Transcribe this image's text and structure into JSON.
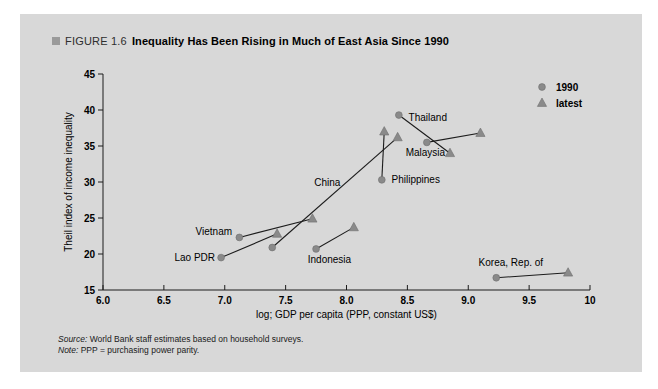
{
  "figure": {
    "label": "FIGURE 1.6",
    "title": "Inequality Has Been Rising in Much of East Asia Since 1990"
  },
  "chart_data": {
    "type": "scatter",
    "title": "Inequality Has Been Rising in Much of East Asia Since 1990",
    "xlabel": "log; GDP per capita (PPP, constant US$)",
    "ylabel": "Theil index of income inequality",
    "xlim": [
      6.0,
      10.0
    ],
    "ylim": [
      15,
      45
    ],
    "x_tick_labels": [
      "6.0",
      "6.5",
      "7.0",
      "7.5",
      "8.0",
      "8.5",
      "9.0",
      "9.5",
      "10"
    ],
    "x_tick_values": [
      6.0,
      6.5,
      7.0,
      7.5,
      8.0,
      8.5,
      9.0,
      9.5,
      10.0
    ],
    "y_tick_values": [
      15,
      20,
      25,
      30,
      35,
      40,
      45
    ],
    "grid": false,
    "legend_position": "top-right",
    "legend": [
      {
        "label": "1990",
        "marker": "circle"
      },
      {
        "label": "latest",
        "marker": "triangle"
      }
    ],
    "series": [
      {
        "name": "Lao PDR",
        "p1990": [
          6.97,
          19.5
        ],
        "latest": [
          7.43,
          22.8
        ],
        "label_at": [
          6.92,
          19.5
        ],
        "label_anchor": "end"
      },
      {
        "name": "Vietnam",
        "p1990": [
          7.12,
          22.3
        ],
        "latest": [
          7.72,
          24.9
        ],
        "label_at": [
          7.06,
          23.1
        ],
        "label_anchor": "end"
      },
      {
        "name": "China",
        "p1990": [
          7.39,
          20.9
        ],
        "latest": [
          8.42,
          36.2
        ],
        "label_at": [
          7.95,
          30.0
        ],
        "label_anchor": "end"
      },
      {
        "name": "Indonesia",
        "p1990": [
          7.75,
          20.7
        ],
        "latest": [
          8.06,
          23.7
        ],
        "label_at": [
          7.86,
          19.2
        ],
        "label_anchor": "middle"
      },
      {
        "name": "Philippines",
        "p1990": [
          8.29,
          30.3
        ],
        "latest": [
          8.31,
          37.0
        ],
        "label_at": [
          8.37,
          30.3
        ],
        "label_anchor": "start"
      },
      {
        "name": "Thailand",
        "p1990": [
          8.43,
          39.3
        ],
        "latest": [
          8.85,
          34.0
        ],
        "label_at": [
          8.51,
          39.0
        ],
        "label_anchor": "start"
      },
      {
        "name": "Malaysia",
        "p1990": [
          8.66,
          35.5
        ],
        "latest": [
          9.1,
          36.8
        ],
        "label_at": [
          8.81,
          34.1
        ],
        "label_anchor": "end"
      },
      {
        "name": "Korea, Rep. of",
        "p1990": [
          9.23,
          16.7
        ],
        "latest": [
          9.82,
          17.4
        ],
        "label_at": [
          9.35,
          18.8
        ],
        "label_anchor": "middle"
      }
    ],
    "colors": {
      "panel_bg": "#d8d8d8",
      "marker": "#8a8a8a",
      "marker_edge": "#6f6f6f",
      "line": "#1c1c1c",
      "axis": "#1c1c1c",
      "text": "#000000"
    }
  },
  "footer": {
    "source_label": "Source:",
    "source_text": " World Bank staff estimates based on household surveys.",
    "note_label": "Note:",
    "note_text": " PPP = purchasing power parity."
  }
}
